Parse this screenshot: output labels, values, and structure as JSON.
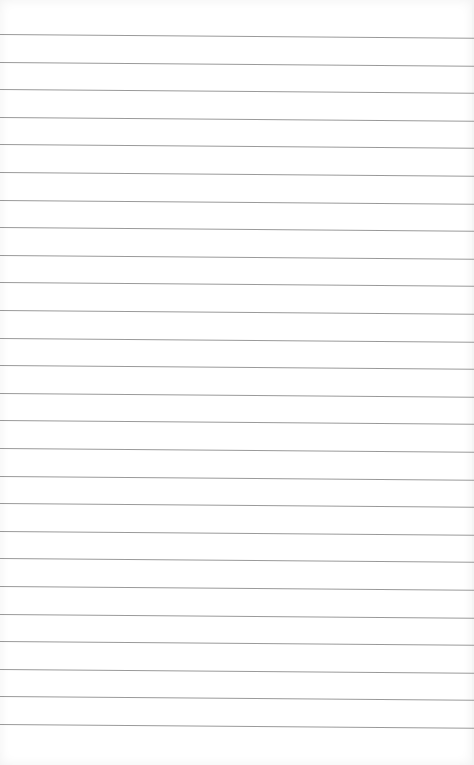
{
  "page": {
    "type": "lined-paper",
    "background_color": "#ffffff",
    "rule_color": "#8e8e8e",
    "rule_count": 26,
    "first_rule_y": 34,
    "rule_spacing": 27.6,
    "text": ""
  }
}
